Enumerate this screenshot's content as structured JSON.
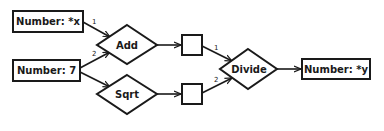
{
  "diagram": {
    "type": "dataflow",
    "nodes": {
      "input_x": {
        "label": "Number: *x",
        "shape": "rectangle"
      },
      "input_7": {
        "label": "Number: 7",
        "shape": "rectangle"
      },
      "add": {
        "label": "Add",
        "shape": "diamond"
      },
      "sqrt": {
        "label": "Sqrt",
        "shape": "diamond"
      },
      "add_result": {
        "label": "",
        "shape": "rectangle"
      },
      "sqrt_result": {
        "label": "",
        "shape": "rectangle"
      },
      "divide": {
        "label": "Divide",
        "shape": "diamond"
      },
      "output_y": {
        "label": "Number: *y",
        "shape": "rectangle"
      }
    },
    "edges": [
      {
        "from": "input_x",
        "to": "add",
        "port": "1"
      },
      {
        "from": "input_7",
        "to": "add",
        "port": "2"
      },
      {
        "from": "input_7",
        "to": "sqrt",
        "port": ""
      },
      {
        "from": "add",
        "to": "add_result",
        "port": ""
      },
      {
        "from": "sqrt",
        "to": "sqrt_result",
        "port": ""
      },
      {
        "from": "add_result",
        "to": "divide",
        "port": "1"
      },
      {
        "from": "sqrt_result",
        "to": "divide",
        "port": "2"
      },
      {
        "from": "divide",
        "to": "output_y",
        "port": ""
      }
    ],
    "port_labels": {
      "add_in1": "1",
      "add_in2": "2",
      "divide_in1": "1",
      "divide_in2": "2"
    },
    "colors": {
      "stroke": "#1a1a1a",
      "fill": "#ffffff",
      "text": "#1a1a1a"
    }
  }
}
